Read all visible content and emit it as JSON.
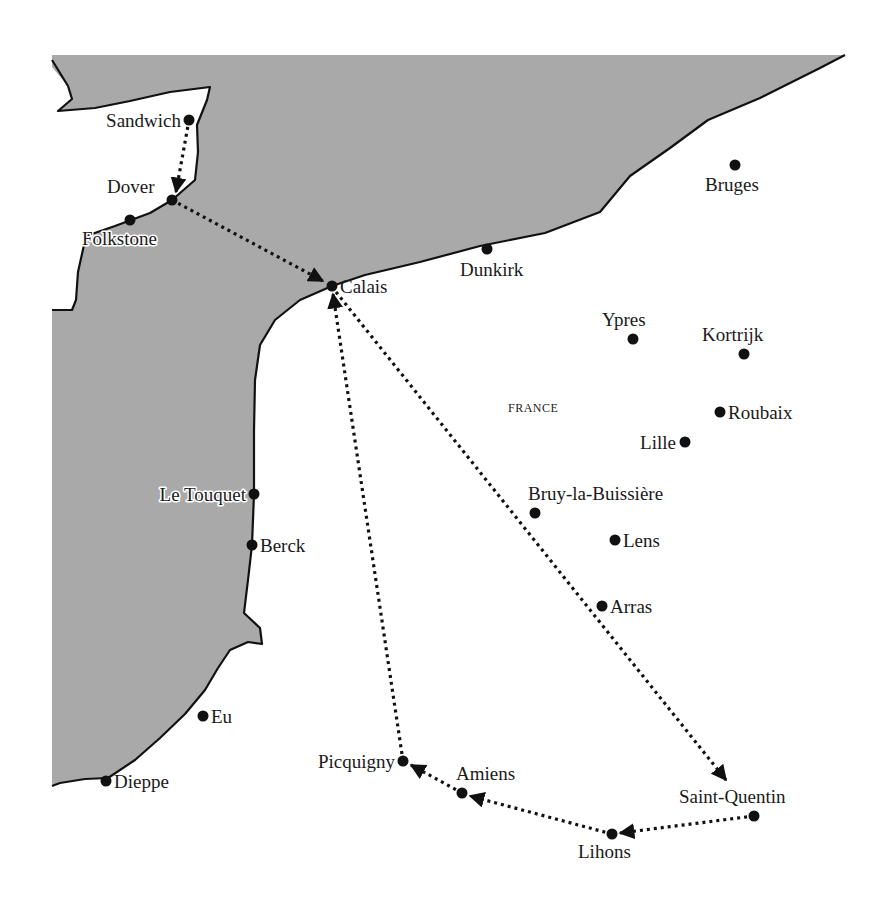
{
  "map": {
    "country_label": "FRANCE",
    "colors": {
      "sea": "#a9a9a9",
      "land": "#ffffff",
      "coastline": "#111111",
      "route": "#111111",
      "marker": "#111111"
    },
    "places": [
      {
        "name": "Sandwich",
        "x": 189,
        "y": 120
      },
      {
        "name": "Dover",
        "x": 172,
        "y": 200
      },
      {
        "name": "Folkstone",
        "x": 130,
        "y": 220
      },
      {
        "name": "Calais",
        "x": 332,
        "y": 286
      },
      {
        "name": "Dunkirk",
        "x": 487,
        "y": 249
      },
      {
        "name": "Bruges",
        "x": 735,
        "y": 165
      },
      {
        "name": "Ypres",
        "x": 633,
        "y": 339
      },
      {
        "name": "Kortrijk",
        "x": 744,
        "y": 354
      },
      {
        "name": "Roubaix",
        "x": 720,
        "y": 412
      },
      {
        "name": "Lille",
        "x": 685,
        "y": 442
      },
      {
        "name": "Le Touquet",
        "x": 254,
        "y": 494
      },
      {
        "name": "Berck",
        "x": 252,
        "y": 545
      },
      {
        "name": "Bruy-la-Buissière",
        "x": 535,
        "y": 513
      },
      {
        "name": "Lens",
        "x": 615,
        "y": 540
      },
      {
        "name": "Arras",
        "x": 602,
        "y": 606
      },
      {
        "name": "Eu",
        "x": 203,
        "y": 716
      },
      {
        "name": "Dieppe",
        "x": 106,
        "y": 781
      },
      {
        "name": "Picquigny",
        "x": 403,
        "y": 761
      },
      {
        "name": "Amiens",
        "x": 462,
        "y": 793
      },
      {
        "name": "Lihons",
        "x": 612,
        "y": 834
      },
      {
        "name": "Saint-Quentin",
        "x": 754,
        "y": 816
      }
    ],
    "route": [
      "Sandwich",
      "Dover",
      "Calais",
      "Saint-Quentin",
      "Lihons",
      "Amiens",
      "Picquigny",
      "Calais"
    ]
  }
}
